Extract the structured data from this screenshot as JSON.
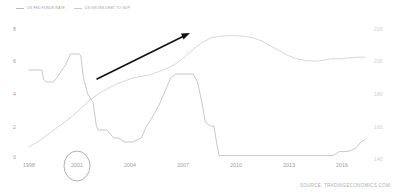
{
  "legend": {
    "items": [
      {
        "label": "US FED FUNDS RATE",
        "color": "#b0b0b0",
        "icon": "line-swatch-icon"
      },
      {
        "label": "US GROSS DEBT TO GDP",
        "color": "#c4c4c4",
        "icon": "line-swatch-icon"
      }
    ]
  },
  "source": {
    "text": "SOURCE: TRADINGECONOMICS.COM"
  },
  "axes": {
    "left_ticks": [
      "8",
      "6",
      "4",
      "2",
      "0"
    ],
    "right_ticks": [
      "220",
      "200",
      "180",
      "160",
      "140"
    ],
    "x_ticks": [
      "1998",
      "2001",
      "2004",
      "2007",
      "2010",
      "2013",
      "2016"
    ]
  },
  "annotations": {
    "arrow": {
      "name": "trend-arrow",
      "from_year": 2000.6,
      "to_year": 2006.3,
      "description": "black upward trend arrow"
    },
    "circle": {
      "name": "year-highlight-circle",
      "label": "2001"
    }
  },
  "chart_data": {
    "type": "line",
    "title": "",
    "subtitle": "",
    "xlabel": "",
    "ylabel": "",
    "grid": false,
    "legend_position": "top-left",
    "xlim": [
      1998,
      2017.5
    ],
    "x_ticks": [
      1998,
      2001,
      2004,
      2007,
      2010,
      2013,
      2016
    ],
    "series": [
      {
        "name": "US FED FUNDS RATE",
        "axis": "left",
        "unit": "percent",
        "ylim": [
          0,
          8
        ],
        "y_ticks": [
          0,
          2,
          4,
          6,
          8
        ],
        "color": "#b0b0b0",
        "points": [
          [
            1998.0,
            5.5
          ],
          [
            1998.4,
            5.5
          ],
          [
            1998.75,
            5.5
          ],
          [
            1998.85,
            4.9
          ],
          [
            1999.0,
            4.75
          ],
          [
            1999.4,
            4.75
          ],
          [
            1999.6,
            5.0
          ],
          [
            1999.9,
            5.5
          ],
          [
            2000.1,
            5.8
          ],
          [
            2000.4,
            6.5
          ],
          [
            2000.6,
            6.5
          ],
          [
            2000.9,
            6.5
          ],
          [
            2001.0,
            6.4
          ],
          [
            2001.15,
            5.0
          ],
          [
            2001.4,
            4.0
          ],
          [
            2001.7,
            3.5
          ],
          [
            2001.9,
            2.0
          ],
          [
            2002.0,
            1.75
          ],
          [
            2002.5,
            1.75
          ],
          [
            2002.9,
            1.25
          ],
          [
            2003.2,
            1.25
          ],
          [
            2003.5,
            1.0
          ],
          [
            2004.0,
            1.0
          ],
          [
            2004.5,
            1.25
          ],
          [
            2004.8,
            2.0
          ],
          [
            2005.1,
            2.5
          ],
          [
            2005.5,
            3.25
          ],
          [
            2005.9,
            4.25
          ],
          [
            2006.2,
            5.0
          ],
          [
            2006.5,
            5.25
          ],
          [
            2007.0,
            5.25
          ],
          [
            2007.5,
            5.25
          ],
          [
            2007.75,
            4.75
          ],
          [
            2008.0,
            3.5
          ],
          [
            2008.2,
            2.25
          ],
          [
            2008.5,
            2.0
          ],
          [
            2008.7,
            2.0
          ],
          [
            2008.85,
            1.0
          ],
          [
            2009.0,
            0.15
          ],
          [
            2010.0,
            0.15
          ],
          [
            2012.0,
            0.15
          ],
          [
            2014.0,
            0.15
          ],
          [
            2015.6,
            0.15
          ],
          [
            2015.95,
            0.4
          ],
          [
            2016.3,
            0.4
          ],
          [
            2016.6,
            0.45
          ],
          [
            2016.95,
            0.65
          ],
          [
            2017.2,
            1.0
          ],
          [
            2017.45,
            1.15
          ]
        ]
      },
      {
        "name": "US GROSS DEBT TO GDP",
        "axis": "right",
        "unit": "percent of GDP",
        "ylim": [
          140,
          220
        ],
        "y_ticks": [
          140,
          160,
          180,
          200,
          220
        ],
        "color": "#c4c4c4",
        "points": [
          [
            1998.0,
            147
          ],
          [
            1998.5,
            150
          ],
          [
            1999.0,
            154
          ],
          [
            1999.5,
            158
          ],
          [
            2000.0,
            162
          ],
          [
            2000.5,
            166
          ],
          [
            2001.0,
            171
          ],
          [
            2001.5,
            176
          ],
          [
            2002.0,
            180
          ],
          [
            2002.5,
            183
          ],
          [
            2003.0,
            186
          ],
          [
            2003.5,
            188
          ],
          [
            2004.0,
            190
          ],
          [
            2004.5,
            191
          ],
          [
            2005.0,
            192
          ],
          [
            2005.5,
            194
          ],
          [
            2006.0,
            196
          ],
          [
            2006.5,
            199
          ],
          [
            2007.0,
            203
          ],
          [
            2007.5,
            208
          ],
          [
            2008.0,
            212
          ],
          [
            2008.5,
            215
          ],
          [
            2009.0,
            216
          ],
          [
            2009.5,
            216.5
          ],
          [
            2010.0,
            216.5
          ],
          [
            2010.5,
            216
          ],
          [
            2011.0,
            215
          ],
          [
            2011.5,
            213
          ],
          [
            2012.0,
            210
          ],
          [
            2012.5,
            207
          ],
          [
            2013.0,
            204
          ],
          [
            2013.5,
            202
          ],
          [
            2014.0,
            201
          ],
          [
            2014.5,
            200.5
          ],
          [
            2015.0,
            201
          ],
          [
            2015.5,
            202
          ],
          [
            2016.0,
            202
          ],
          [
            2016.5,
            202.5
          ],
          [
            2017.0,
            203
          ],
          [
            2017.45,
            203
          ]
        ]
      }
    ]
  }
}
